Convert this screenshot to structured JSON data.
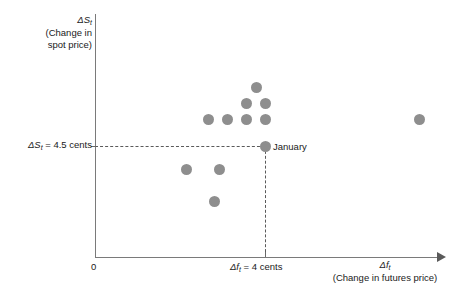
{
  "figure": {
    "background_color": "#ffffff",
    "axis_color": "#7a7a7a",
    "point_color": "#8e8e8e",
    "guide_color": "#5a5a5a"
  },
  "labels": {
    "origin": "0",
    "y_axis_title_line1": "ΔS",
    "y_axis_title_sub": "t",
    "y_axis_title_line2": "(Change in",
    "y_axis_title_line3": "spot price)",
    "y_tick_prefix": "ΔS",
    "y_tick_sub": "t",
    "y_tick_value": " = 4.5 cents",
    "x_tick_prefix": "Δf",
    "x_tick_sub": "t",
    "x_tick_value": " = 4 cents",
    "x_axis_title_line1_prefix": "Δf",
    "x_axis_title_sub": "t",
    "x_axis_title_line2": "(Change in futures price)",
    "annotation_january": "January"
  },
  "chart_data": {
    "type": "scatter",
    "title": "",
    "xlabel": "Δf_t (Change in futures price)",
    "ylabel": "ΔS_t (Change in spot price)",
    "grid": false,
    "legend": null,
    "axis_origin_label": "0",
    "x_reference_line": {
      "label": "Δf_t = 4 cents",
      "value": 4,
      "style": "dashed"
    },
    "y_reference_line": {
      "label": "ΔS_t = 4.5 cents",
      "value": 4.5,
      "style": "dashed"
    },
    "highlighted_point": {
      "name": "January",
      "x": 4,
      "y": 4.5
    },
    "points": [
      {
        "px": 208,
        "py": 119
      },
      {
        "px": 227,
        "py": 119
      },
      {
        "px": 246,
        "py": 119
      },
      {
        "px": 265,
        "py": 119
      },
      {
        "px": 246,
        "py": 103
      },
      {
        "px": 265,
        "py": 103
      },
      {
        "px": 256,
        "py": 87
      },
      {
        "px": 419,
        "py": 119
      },
      {
        "px": 186,
        "py": 169
      },
      {
        "px": 219,
        "py": 169
      },
      {
        "px": 214,
        "py": 201
      },
      {
        "px": 265,
        "py": 146
      }
    ]
  }
}
